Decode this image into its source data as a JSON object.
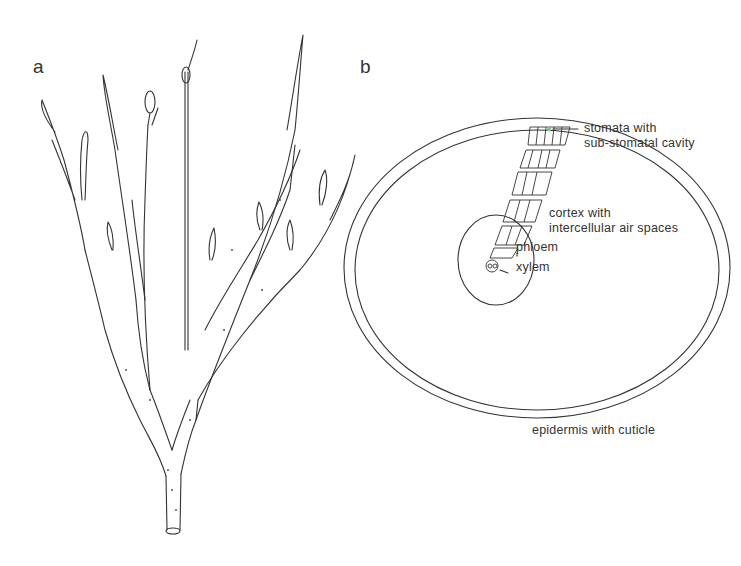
{
  "figure": {
    "panels": [
      {
        "id": "a",
        "label": "a",
        "subject": "branching plant shoot (habit drawing)"
      },
      {
        "id": "b",
        "label": "b",
        "subject": "stem transverse section"
      }
    ],
    "annotations": {
      "stomata": "stomata with\nsub-stomatal cavity",
      "cortex": "cortex with\nintercellular air spaces",
      "phloem": "phloem",
      "xylem": "xylem",
      "epidermis": "epidermis with cuticle"
    },
    "colors": {
      "line": "#333333",
      "background": "#ffffff",
      "stomata_highlight": "#7fc97f"
    }
  }
}
